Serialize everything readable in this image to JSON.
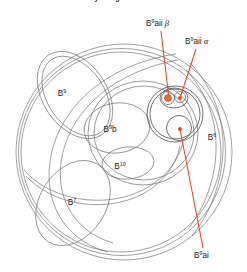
{
  "figure": {
    "caption_top": "Reconstructed 4-cell embryo stage",
    "background_color": "#ffffff",
    "outline_color": "#6b6b6b",
    "annotation_color": "#e8442a",
    "dot_fill_color": "#d9743a",
    "label_color": "#1c1c1c"
  },
  "labels": {
    "b9": {
      "base": "B",
      "sup": "9",
      "x": 62,
      "y": 93
    },
    "b9b": {
      "base": "B",
      "sup": "9",
      "suffix": "b",
      "x": 110,
      "y": 129
    },
    "b10": {
      "base": "B",
      "sup": "10",
      "x": 120,
      "y": 169
    },
    "b7": {
      "base": "B",
      "sup": "7",
      "x": 72,
      "y": 202
    },
    "b6": {
      "base": "B",
      "sup": "6",
      "x": 212,
      "y": 137
    }
  },
  "annotations": [
    {
      "id": "b9aii-beta",
      "base": "B",
      "sup": "9",
      "suffix": "aii",
      "greek": "β",
      "text_x": 146,
      "text_y": 26,
      "leader": [
        [
          160,
          31
        ],
        [
          168,
          98
        ]
      ],
      "target_x": 168,
      "target_y": 98
    },
    {
      "id": "b9aii-alpha",
      "base": "B",
      "sup": "9",
      "suffix": "aii",
      "greek": "α",
      "text_x": 185,
      "text_y": 44,
      "leader": [
        [
          194,
          49
        ],
        [
          179,
          97
        ]
      ],
      "target_x": 179,
      "target_y": 97
    },
    {
      "id": "b9ai",
      "base": "B",
      "sup": "9",
      "suffix": "ai",
      "greek": "",
      "text_x": 194,
      "text_y": 258,
      "leader": [
        [
          202,
          249
        ],
        [
          179,
          128
        ]
      ],
      "target_x": 179,
      "target_y": 128
    }
  ],
  "markers": [
    {
      "name": "marker-beta",
      "cx": 168,
      "cy": 98,
      "r": 3.2,
      "filled": true
    },
    {
      "name": "marker-alpha",
      "cx": 179,
      "cy": 97,
      "r": 1.6,
      "filled": false
    },
    {
      "name": "marker-ai",
      "cx": 179,
      "cy": 128,
      "r": 1.7,
      "filled": false
    }
  ]
}
